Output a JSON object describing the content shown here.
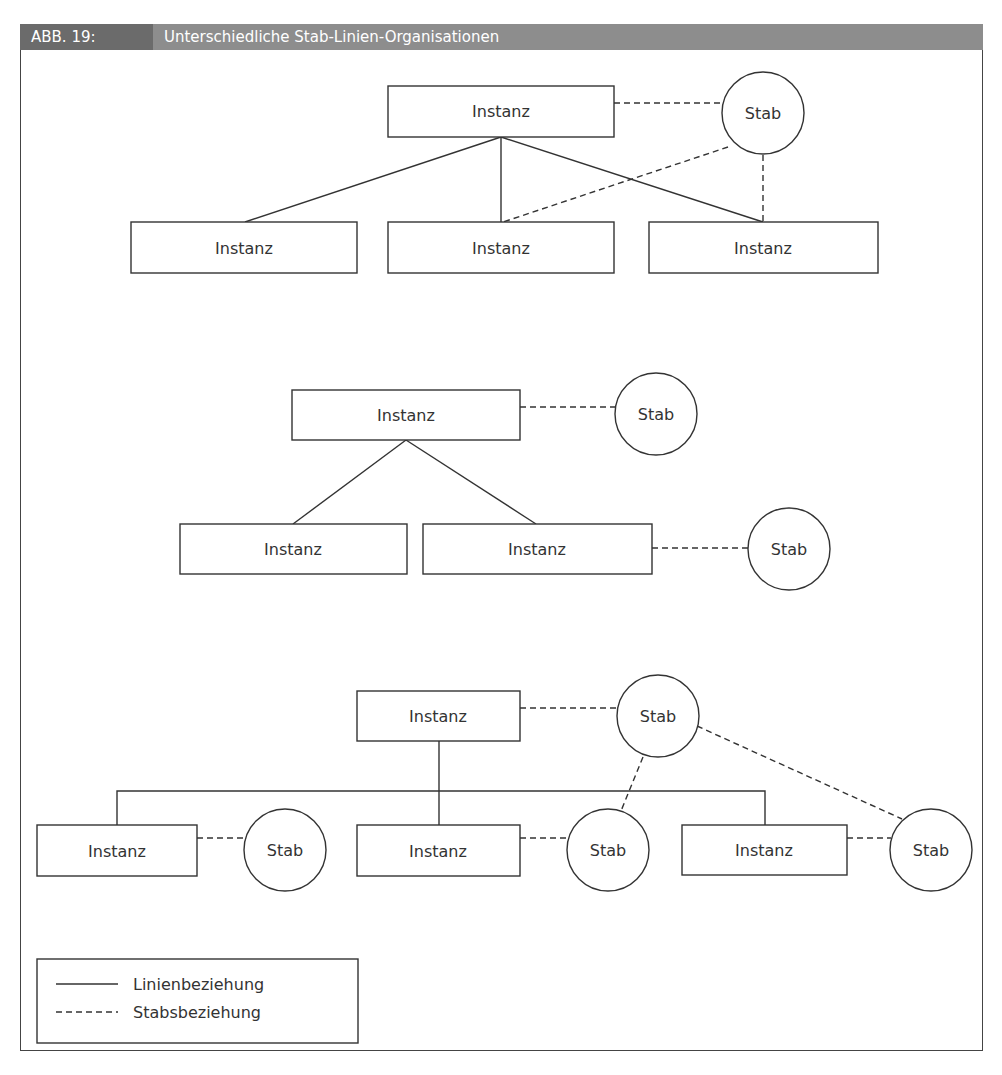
{
  "header": {
    "label": "ABB. 19:",
    "title": "Unterschiedliche Stab-Linien-Organisationen"
  },
  "labels": {
    "instanz": "Instanz",
    "stab": "Stab"
  },
  "legend": {
    "solid": "Linienbeziehung",
    "dashed": "Stabsbeziehung"
  },
  "colors": {
    "header_label_bg": "#6b6b6b",
    "header_title_bg": "#8d8d8d",
    "line": "#333333"
  },
  "diagrams": [
    {
      "name": "stab-linien-1",
      "instanzen": 4,
      "stabs": 1
    },
    {
      "name": "stab-linien-2",
      "instanzen": 3,
      "stabs": 2
    },
    {
      "name": "stab-linien-3",
      "instanzen": 4,
      "stabs": 4
    }
  ]
}
